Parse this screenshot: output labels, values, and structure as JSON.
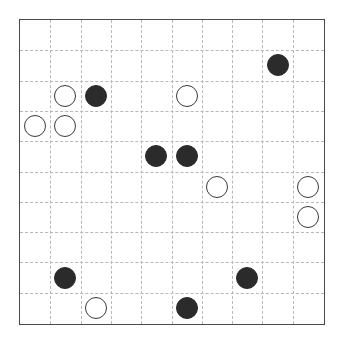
{
  "board": {
    "rows": 10,
    "cols": 10,
    "colors": {
      "black": "#2b2b2b",
      "white": "#ffffff",
      "border": "#4a4a4a",
      "gridline": "#b8b8b8"
    },
    "pieces": [
      {
        "row": 1,
        "col": 8,
        "color": "black"
      },
      {
        "row": 2,
        "col": 1,
        "color": "white"
      },
      {
        "row": 2,
        "col": 2,
        "color": "black"
      },
      {
        "row": 2,
        "col": 5,
        "color": "white"
      },
      {
        "row": 3,
        "col": 0,
        "color": "white"
      },
      {
        "row": 3,
        "col": 1,
        "color": "white"
      },
      {
        "row": 4,
        "col": 4,
        "color": "black"
      },
      {
        "row": 4,
        "col": 5,
        "color": "black"
      },
      {
        "row": 5,
        "col": 6,
        "color": "white"
      },
      {
        "row": 5,
        "col": 9,
        "color": "white"
      },
      {
        "row": 6,
        "col": 9,
        "color": "white"
      },
      {
        "row": 8,
        "col": 1,
        "color": "black"
      },
      {
        "row": 8,
        "col": 7,
        "color": "black"
      },
      {
        "row": 9,
        "col": 2,
        "color": "white"
      },
      {
        "row": 9,
        "col": 5,
        "color": "black"
      }
    ]
  }
}
